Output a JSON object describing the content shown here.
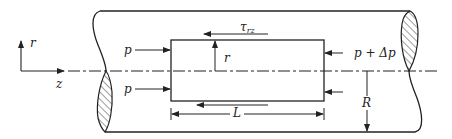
{
  "diagram": {
    "axes": {
      "vertical_label": "r",
      "horizontal_label": "z"
    },
    "labels": {
      "pressure_left_top": "p",
      "pressure_left_bottom": "p",
      "pressure_right": "p + Δp",
      "shear_stress_symbol": "τ",
      "shear_stress_subscript": "rz",
      "radius_element": "r",
      "length": "L",
      "pipe_radius": "R"
    },
    "colors": {
      "line": "#222222",
      "background": "#ffffff"
    }
  }
}
